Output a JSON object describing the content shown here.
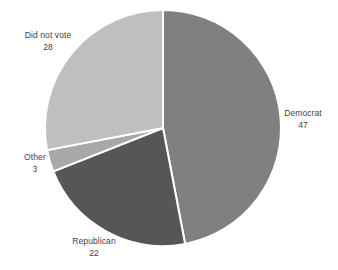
{
  "chart_data": {
    "type": "pie",
    "title": "",
    "subtitle": "",
    "xlabel": "",
    "ylabel": "",
    "legend_position": "none",
    "grid": false,
    "label_format": "name and value on separate lines",
    "total": 100,
    "start_angle_deg": 0,
    "direction": "clockwise",
    "categories": [
      "Democrat",
      "Republican",
      "Other",
      "Did not vote"
    ],
    "values": [
      47,
      22,
      3,
      28
    ],
    "colors": [
      "#808080",
      "#565656",
      "#a8a8a8",
      "#bfbfbf"
    ],
    "slice_border_color": "#ffffff",
    "slices": [
      {
        "name": "Democrat",
        "value": 47,
        "color": "#808080",
        "label_name": "Democrat",
        "label_value": "47",
        "start_deg": 0,
        "end_deg": 169.2
      },
      {
        "name": "Republican",
        "value": 22,
        "color": "#565656",
        "label_name": "Republican",
        "label_value": "22",
        "start_deg": 169.2,
        "end_deg": 248.4
      },
      {
        "name": "Other",
        "value": 3,
        "color": "#a8a8a8",
        "label_name": "Other",
        "label_value": "3",
        "start_deg": 248.4,
        "end_deg": 259.2
      },
      {
        "name": "Did not vote",
        "value": 28,
        "color": "#bfbfbf",
        "label_name": "Did not vote",
        "label_value": "28",
        "start_deg": 259.2,
        "end_deg": 360
      }
    ]
  },
  "figure": {
    "background_color": "#ffffff",
    "label_text_color": "#3f3f3f",
    "center_x": 163,
    "center_y": 128,
    "radius": 118
  }
}
